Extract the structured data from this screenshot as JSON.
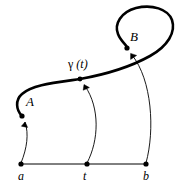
{
  "figure": {
    "background_color": "#ffffff",
    "stroke_color": "#000000",
    "curve": {
      "name": "gamma-curve",
      "stroke_width": 2.6,
      "description": "thick self-intersecting curve from A rising rightward then looping counterclockwise to B"
    },
    "interval": {
      "name": "domain-interval",
      "stroke_width": 1.0,
      "y": 164,
      "x_start": 21,
      "x_end": 146
    },
    "labels": {
      "A": "A",
      "B": "B",
      "gamma_symbol": "γ",
      "gamma_arg": "(t)",
      "gamma_full": "γ (t)",
      "a": "a",
      "t": "t",
      "b": "b"
    },
    "points": [
      {
        "name": "point-a",
        "label": "a",
        "x": 21,
        "y": 164
      },
      {
        "name": "point-t",
        "label": "t",
        "x": 87,
        "y": 164
      },
      {
        "name": "point-b",
        "label": "b",
        "x": 146,
        "y": 164
      },
      {
        "name": "point-A",
        "label": "A",
        "x": 22,
        "y": 116
      },
      {
        "name": "point-gamma-t",
        "label": "γ (t)",
        "x": 80,
        "y": 79
      },
      {
        "name": "point-B",
        "label": "B",
        "x": 127,
        "y": 48
      }
    ],
    "mapping_arrows": [
      {
        "name": "arrow-a-to-A",
        "from": "a",
        "to": "A",
        "stroke_width": 0.9
      },
      {
        "name": "arrow-t-to-gamma-t",
        "from": "t",
        "to": "γ (t)",
        "stroke_width": 0.9
      },
      {
        "name": "arrow-b-to-B",
        "from": "b",
        "to": "B",
        "stroke_width": 0.9
      }
    ]
  }
}
